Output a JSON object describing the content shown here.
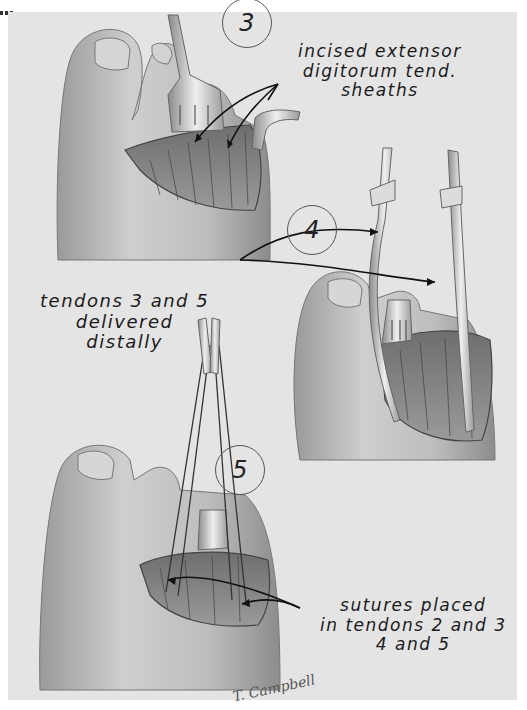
{
  "figure": {
    "panels": [
      {
        "step": "3",
        "caption": "incised extensor\ndigitorum tend.\nsheaths"
      },
      {
        "step": "4",
        "caption": "tendons 3 and 5\ndelivered\ndistally"
      },
      {
        "step": "5",
        "caption": "sutures placed\nin tendons 2 and 3\n4 and 5"
      }
    ],
    "signature": "T. Campbell",
    "colors": {
      "background": "#e4e4e4",
      "page": "#ffffff",
      "ink": "#1a1a1a",
      "skin": "#c8c8c8",
      "shadow": "#8a8a8a"
    }
  }
}
